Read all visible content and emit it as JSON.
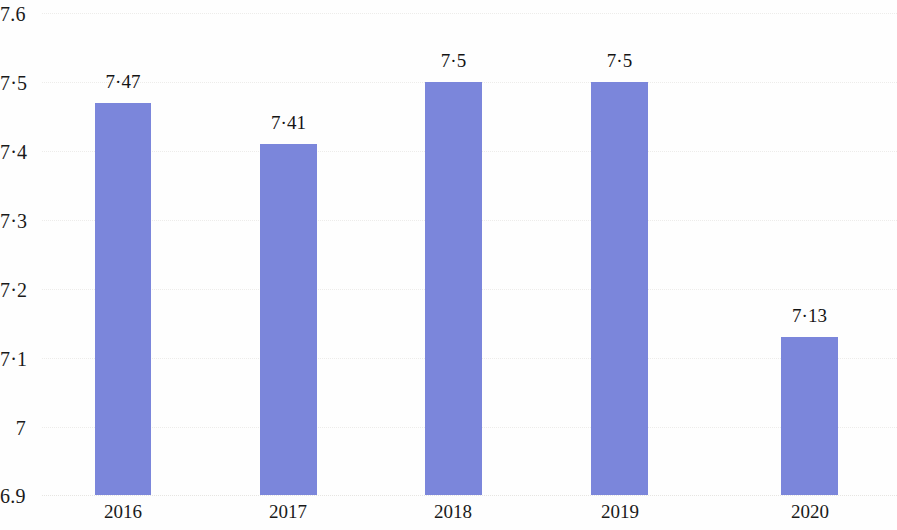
{
  "chart_data": {
    "type": "bar",
    "title": "",
    "subtitle": "",
    "xlabel": "",
    "ylabel": "",
    "categories": [
      "2016",
      "2017",
      "2018",
      "2019",
      "2020"
    ],
    "values": [
      7.47,
      7.41,
      7.5,
      7.5,
      7.13
    ],
    "value_labels": [
      "7·47",
      "7·41",
      "7·5",
      "7·5",
      "7·13"
    ],
    "ylim": [
      6.9,
      7.6
    ],
    "y_ticks": [
      6.9,
      7,
      7.1,
      7.2,
      7.3,
      7.4,
      7.5,
      7.6
    ],
    "y_tick_labels": [
      "6.9",
      "7",
      "7·1",
      "7·2",
      "7·3",
      "7·4",
      "7·5",
      "7.6"
    ],
    "grid": true,
    "grid_axis": "y",
    "legend": null,
    "legend_position": "none",
    "series": [
      {
        "name": "",
        "values": [
          7.47,
          7.41,
          7.5,
          7.5,
          7.13
        ],
        "color": "#7b86db"
      }
    ]
  },
  "style": {
    "bar_color": "#7b86db",
    "background": "#fefefe",
    "gridline_color": "#edecea",
    "text_color": "#1a1a1a"
  }
}
